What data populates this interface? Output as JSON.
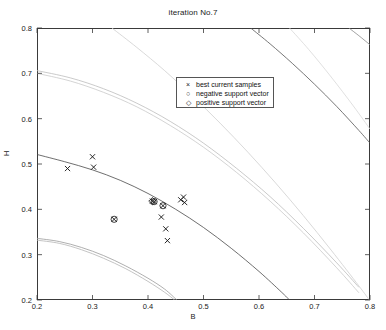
{
  "chart_data": {
    "type": "scatter",
    "title": "iteration No.7",
    "xlabel": "B",
    "ylabel": "H",
    "xlim": [
      0.2,
      0.8
    ],
    "ylim": [
      0.2,
      0.8
    ],
    "xticks": [
      0.2,
      0.3,
      0.4,
      0.5,
      0.6,
      0.7,
      0.8
    ],
    "yticks": [
      0.2,
      0.3,
      0.4,
      0.5,
      0.6,
      0.7,
      0.8
    ],
    "xticklabels": [
      "0.2",
      "0.3",
      "0.4",
      "0.5",
      "0.6",
      "0.7",
      "0.8"
    ],
    "yticklabels": [
      "0.2",
      "0.3",
      "0.4",
      "0.5",
      "0.6",
      "0.7",
      "0.8"
    ],
    "grid": false,
    "legend_position": "upper-center",
    "legend": [
      {
        "marker": "x",
        "label": "best current samples"
      },
      {
        "marker": "o",
        "label": "negative support vector"
      },
      {
        "marker": "d",
        "label": "positive support vector"
      }
    ],
    "series": [
      {
        "name": "best current samples",
        "marker": "x",
        "color": "#111111",
        "points": [
          [
            0.255,
            0.49
          ],
          [
            0.3,
            0.516
          ],
          [
            0.302,
            0.493
          ],
          [
            0.408,
            0.418
          ],
          [
            0.411,
            0.417
          ],
          [
            0.424,
            0.383
          ],
          [
            0.432,
            0.357
          ],
          [
            0.435,
            0.331
          ],
          [
            0.459,
            0.421
          ],
          [
            0.464,
            0.427
          ],
          [
            0.466,
            0.415
          ],
          [
            0.427,
            0.408
          ],
          [
            0.339,
            0.378
          ]
        ]
      },
      {
        "name": "negative support vector",
        "marker": "o",
        "color": "#111111",
        "points": [
          [
            0.339,
            0.378
          ],
          [
            0.427,
            0.408
          ],
          [
            0.411,
            0.417
          ]
        ]
      },
      {
        "name": "positive support vector",
        "marker": "d",
        "color": "#111111",
        "points": [
          [
            0.408,
            0.418
          ]
        ]
      }
    ],
    "contours": [
      {
        "name": "upper-light-pair-a",
        "color": "#bdbdbd",
        "points": [
          [
            0.2,
            0.706
          ],
          [
            0.26,
            0.69
          ],
          [
            0.32,
            0.666
          ],
          [
            0.38,
            0.634
          ],
          [
            0.44,
            0.594
          ],
          [
            0.5,
            0.546
          ],
          [
            0.56,
            0.49
          ],
          [
            0.62,
            0.428
          ],
          [
            0.68,
            0.358
          ],
          [
            0.74,
            0.282
          ],
          [
            0.78,
            0.228
          ]
        ]
      },
      {
        "name": "upper-light-pair-b",
        "color": "#c9c9c9",
        "points": [
          [
            0.2,
            0.7
          ],
          [
            0.26,
            0.683
          ],
          [
            0.32,
            0.658
          ],
          [
            0.38,
            0.626
          ],
          [
            0.44,
            0.585
          ],
          [
            0.5,
            0.537
          ],
          [
            0.56,
            0.481
          ],
          [
            0.62,
            0.418
          ],
          [
            0.68,
            0.348
          ],
          [
            0.74,
            0.271
          ],
          [
            0.78,
            0.216
          ]
        ]
      },
      {
        "name": "decision-boundary",
        "color": "#4a4a4a",
        "points": [
          [
            0.2,
            0.521
          ],
          [
            0.25,
            0.505
          ],
          [
            0.3,
            0.487
          ],
          [
            0.35,
            0.464
          ],
          [
            0.4,
            0.435
          ],
          [
            0.45,
            0.4
          ],
          [
            0.5,
            0.36
          ],
          [
            0.55,
            0.314
          ],
          [
            0.6,
            0.263
          ],
          [
            0.64,
            0.218
          ],
          [
            0.655,
            0.2
          ]
        ]
      },
      {
        "name": "lower-light-pair-a",
        "color": "#9a9a9a",
        "points": [
          [
            0.2,
            0.336
          ],
          [
            0.24,
            0.329
          ],
          [
            0.28,
            0.316
          ],
          [
            0.32,
            0.298
          ],
          [
            0.36,
            0.275
          ],
          [
            0.4,
            0.248
          ],
          [
            0.43,
            0.224
          ],
          [
            0.452,
            0.2
          ]
        ]
      },
      {
        "name": "lower-light-pair-b",
        "color": "#b5b5b5",
        "points": [
          [
            0.2,
            0.332
          ],
          [
            0.24,
            0.325
          ],
          [
            0.28,
            0.311
          ],
          [
            0.32,
            0.292
          ],
          [
            0.36,
            0.269
          ],
          [
            0.4,
            0.241
          ],
          [
            0.43,
            0.217
          ],
          [
            0.448,
            0.2
          ]
        ]
      },
      {
        "name": "upper-right-dark",
        "color": "#555555",
        "points": [
          [
            0.585,
            0.8
          ],
          [
            0.62,
            0.765
          ],
          [
            0.66,
            0.722
          ],
          [
            0.7,
            0.676
          ],
          [
            0.74,
            0.627
          ],
          [
            0.78,
            0.574
          ],
          [
            0.8,
            0.546
          ]
        ]
      },
      {
        "name": "upper-right-edge",
        "color": "#8a8a8a",
        "points": [
          [
            0.762,
            0.8
          ],
          [
            0.78,
            0.783
          ],
          [
            0.8,
            0.763
          ]
        ]
      },
      {
        "name": "mid-gray-sweep",
        "color": "#cfcfcf",
        "points": [
          [
            0.335,
            0.8
          ],
          [
            0.38,
            0.757
          ],
          [
            0.43,
            0.706
          ],
          [
            0.48,
            0.65
          ],
          [
            0.53,
            0.59
          ],
          [
            0.58,
            0.526
          ],
          [
            0.63,
            0.458
          ],
          [
            0.68,
            0.386
          ],
          [
            0.73,
            0.31
          ],
          [
            0.78,
            0.231
          ],
          [
            0.8,
            0.198
          ]
        ]
      },
      {
        "name": "far-right-gray",
        "color": "#d8d8d8",
        "points": [
          [
            0.655,
            0.8
          ],
          [
            0.69,
            0.752
          ],
          [
            0.73,
            0.692
          ],
          [
            0.77,
            0.628
          ],
          [
            0.8,
            0.577
          ]
        ]
      }
    ]
  }
}
